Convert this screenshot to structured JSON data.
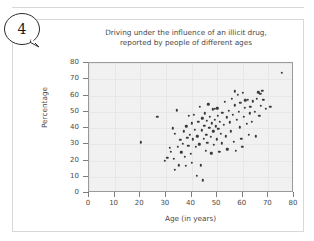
{
  "worksheet": {
    "question_number": "4"
  },
  "chart_data": {
    "type": "scatter",
    "title_line1": "Driving under the influence of an illicit drug,",
    "title_line2": "reported by people of different ages",
    "xlabel": "Age (in years)",
    "ylabel": "Percentage",
    "xlim": [
      0,
      80
    ],
    "ylim": [
      0,
      80
    ],
    "xticks": [
      0,
      10,
      20,
      30,
      40,
      50,
      60,
      70,
      80
    ],
    "yticks": [
      0,
      10,
      20,
      30,
      40,
      50,
      60,
      70,
      80
    ],
    "grid": true,
    "legend": "none",
    "marker_color": "#3a3a3a",
    "plot_background": "#f1f1f1",
    "points": [
      [
        20.2,
        31.2
      ],
      [
        26.6,
        47.0
      ],
      [
        29.6,
        19.8
      ],
      [
        30.6,
        21.5
      ],
      [
        31.5,
        28.0
      ],
      [
        32.0,
        25.2
      ],
      [
        32.6,
        39.8
      ],
      [
        33.0,
        21.0
      ],
      [
        33.4,
        36.6
      ],
      [
        33.6,
        14.4
      ],
      [
        34.2,
        51.0
      ],
      [
        34.6,
        28.6
      ],
      [
        35.0,
        17.0
      ],
      [
        35.6,
        32.8
      ],
      [
        36.0,
        25.0
      ],
      [
        36.5,
        30.2
      ],
      [
        37.0,
        38.0
      ],
      [
        37.4,
        22.4
      ],
      [
        37.8,
        16.8
      ],
      [
        38.0,
        41.0
      ],
      [
        38.4,
        34.0
      ],
      [
        38.8,
        29.0
      ],
      [
        39.0,
        47.5
      ],
      [
        39.4,
        36.0
      ],
      [
        39.8,
        24.0
      ],
      [
        40.0,
        43.0
      ],
      [
        40.2,
        18.5
      ],
      [
        40.6,
        33.0
      ],
      [
        41.0,
        48.0
      ],
      [
        41.2,
        39.0
      ],
      [
        41.6,
        28.5
      ],
      [
        42.0,
        10.5
      ],
      [
        42.2,
        35.0
      ],
      [
        42.6,
        44.0
      ],
      [
        43.0,
        30.0
      ],
      [
        43.2,
        53.0
      ],
      [
        43.6,
        17.0
      ],
      [
        44.0,
        38.5
      ],
      [
        44.2,
        46.0
      ],
      [
        44.4,
        7.8
      ],
      [
        44.8,
        33.5
      ],
      [
        45.0,
        41.5
      ],
      [
        45.2,
        49.0
      ],
      [
        45.5,
        26.0
      ],
      [
        45.8,
        36.0
      ],
      [
        46.0,
        44.5
      ],
      [
        46.2,
        31.0
      ],
      [
        46.6,
        54.5
      ],
      [
        47.0,
        40.0
      ],
      [
        47.2,
        47.0
      ],
      [
        47.5,
        34.5
      ],
      [
        47.8,
        24.5
      ],
      [
        48.0,
        43.0
      ],
      [
        48.2,
        51.5
      ],
      [
        48.5,
        38.0
      ],
      [
        48.8,
        29.5
      ],
      [
        49.0,
        52.0
      ],
      [
        49.2,
        45.0
      ],
      [
        49.5,
        41.0
      ],
      [
        49.8,
        33.0
      ],
      [
        50.0,
        52.2
      ],
      [
        50.2,
        47.5
      ],
      [
        50.5,
        39.5
      ],
      [
        50.8,
        25.5
      ],
      [
        51.0,
        44.0
      ],
      [
        51.4,
        36.5
      ],
      [
        51.8,
        30.5
      ],
      [
        52.0,
        49.5
      ],
      [
        52.5,
        42.0
      ],
      [
        53.0,
        56.0
      ],
      [
        53.4,
        35.0
      ],
      [
        53.8,
        46.5
      ],
      [
        54.0,
        27.0
      ],
      [
        54.5,
        50.5
      ],
      [
        55.0,
        43.5
      ],
      [
        55.4,
        38.0
      ],
      [
        55.8,
        58.0
      ],
      [
        56.0,
        48.0
      ],
      [
        56.4,
        31.5
      ],
      [
        56.8,
        62.5
      ],
      [
        57.0,
        54.0
      ],
      [
        57.2,
        25.8
      ],
      [
        57.6,
        45.0
      ],
      [
        58.0,
        60.5
      ],
      [
        58.4,
        50.0
      ],
      [
        58.8,
        40.5
      ],
      [
        59.0,
        55.5
      ],
      [
        59.4,
        33.5
      ],
      [
        59.8,
        28.5
      ],
      [
        60.0,
        61.5
      ],
      [
        60.4,
        47.0
      ],
      [
        60.8,
        52.5
      ],
      [
        61.0,
        57.0
      ],
      [
        61.5,
        42.5
      ],
      [
        62.0,
        57.5
      ],
      [
        62.4,
        36.0
      ],
      [
        62.8,
        49.0
      ],
      [
        63.0,
        53.0
      ],
      [
        63.6,
        44.0
      ],
      [
        64.0,
        56.5
      ],
      [
        64.6,
        50.0
      ],
      [
        65.0,
        35.0
      ],
      [
        65.4,
        58.0
      ],
      [
        66.0,
        62.0
      ],
      [
        66.4,
        47.5
      ],
      [
        66.8,
        61.0
      ],
      [
        67.0,
        53.5
      ],
      [
        67.6,
        62.8
      ],
      [
        68.0,
        57.5
      ],
      [
        69.0,
        52.0
      ],
      [
        70.8,
        53.0
      ],
      [
        75.2,
        74.0
      ]
    ]
  }
}
